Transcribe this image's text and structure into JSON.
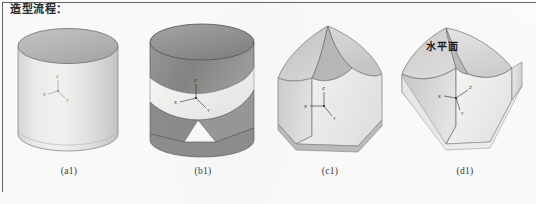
{
  "document": {
    "title": "造型流程：",
    "background_color": "#fcfcfb",
    "rule_color": "#4a4a4a"
  },
  "figure": {
    "kind": "cad-modeling-sequence",
    "panel_count": 4,
    "panels": [
      {
        "id": "a1",
        "caption": "(a1)",
        "shape_name": "cylinder",
        "description": "完整圆柱体",
        "axes": {
          "visible": true,
          "labels": [
            "X",
            "Y",
            "Z"
          ]
        },
        "annotation": "",
        "fill_top": "#b9b9b9",
        "fill_body_light": "#f2f2f0",
        "fill_body_dark": "#c9c9c7",
        "stroke": "#6e6e6e"
      },
      {
        "id": "b1",
        "caption": "(b1)",
        "shape_name": "cylinder-with-saddle-cut",
        "description": "圆柱体中部被马鞍形曲面剖切",
        "axes": {
          "visible": true,
          "labels": [
            "X",
            "Y",
            "Z"
          ]
        },
        "annotation": "",
        "fill_top": "#8f8f8f",
        "fill_body_light": "#f4f4f2",
        "fill_body_dark": "#8a8a8a",
        "stroke": "#5c5c5c"
      },
      {
        "id": "c1",
        "caption": "(c1)",
        "shape_name": "faceted-pointed-solid",
        "description": "切削后形成的尖顶多面体",
        "axes": {
          "visible": true,
          "labels": [
            "X",
            "Y",
            "Z"
          ]
        },
        "annotation": "",
        "fill_top": "#c4c4c2",
        "fill_body_light": "#f6f6f5",
        "fill_body_dark": "#d2d2d0",
        "stroke": "#707070"
      },
      {
        "id": "d1",
        "caption": "(d1)",
        "shape_name": "diamond-faceted-solid",
        "description": "最终菱形多面体，标注水平面",
        "axes": {
          "visible": true,
          "labels": [
            "X",
            "Y",
            "Z"
          ]
        },
        "annotation": "水平面",
        "fill_top": "#c9c9c7",
        "fill_body_light": "#f7f7f6",
        "fill_body_dark": "#d7d7d5",
        "stroke": "#6a6a6a"
      }
    ]
  }
}
